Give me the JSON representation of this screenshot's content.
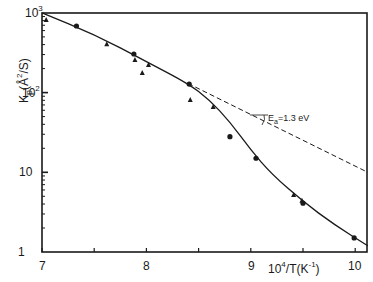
{
  "chart_data": {
    "type": "scatter",
    "title": "",
    "xlabel": "10^4/T(K^-1)",
    "ylabel": "Kp(Å^2/S)",
    "xlim": [
      7,
      10.12
    ],
    "ylim": [
      1,
      1000
    ],
    "yscale": "log",
    "grid": false,
    "legend": null,
    "x_ticks": [
      7,
      8,
      9,
      10
    ],
    "x_minor_ticks": [
      7.5,
      8.5,
      9.5
    ],
    "y_ticks": [
      "1",
      "10",
      "10^2",
      "10^3"
    ],
    "series": [
      {
        "name": "circles",
        "marker": "circle",
        "points": [
          {
            "x": 7.33,
            "y": 685
          },
          {
            "x": 7.88,
            "y": 305
          },
          {
            "x": 8.41,
            "y": 128
          },
          {
            "x": 8.8,
            "y": 28
          },
          {
            "x": 9.05,
            "y": 15
          },
          {
            "x": 9.5,
            "y": 4.1
          },
          {
            "x": 9.99,
            "y": 1.5
          }
        ]
      },
      {
        "name": "triangles",
        "marker": "triangle",
        "points": [
          {
            "x": 7.04,
            "y": 813
          },
          {
            "x": 7.62,
            "y": 405
          },
          {
            "x": 7.89,
            "y": 256
          },
          {
            "x": 7.96,
            "y": 176
          },
          {
            "x": 8.02,
            "y": 222
          },
          {
            "x": 8.42,
            "y": 81
          },
          {
            "x": 8.64,
            "y": 66
          },
          {
            "x": 9.41,
            "y": 5.2
          },
          {
            "x": 9.49,
            "y": 4.4
          }
        ]
      },
      {
        "name": "fit-curve",
        "style": "solid",
        "points": [
          {
            "x": 7.0,
            "y": 1000
          },
          {
            "x": 7.5,
            "y": 540
          },
          {
            "x": 8.0,
            "y": 245
          },
          {
            "x": 8.4,
            "y": 130
          },
          {
            "x": 8.6,
            "y": 82
          },
          {
            "x": 8.8,
            "y": 43
          },
          {
            "x": 9.0,
            "y": 19
          },
          {
            "x": 9.2,
            "y": 9.5
          },
          {
            "x": 9.5,
            "y": 4.3
          },
          {
            "x": 9.8,
            "y": 2.2
          },
          {
            "x": 10.12,
            "y": 1.2
          }
        ]
      },
      {
        "name": "extrapolation",
        "style": "dashed",
        "points": [
          {
            "x": 8.4,
            "y": 130
          },
          {
            "x": 10.12,
            "y": 10
          }
        ]
      }
    ],
    "annotations": [
      {
        "text": "Ea=1.3 eV",
        "x": 9.15,
        "y": 45
      }
    ]
  },
  "labels": {
    "y_tick_1": "1",
    "y_tick_10": "10",
    "y_tick_100_base": "10",
    "y_tick_100_exp": "2",
    "y_tick_1000_base": "10",
    "y_tick_1000_exp": "3",
    "x_tick_7": "7",
    "x_tick_8": "8",
    "x_tick_9": "9",
    "x_tick_10": "10",
    "ylabel_main": "K",
    "ylabel_sub": "p",
    "ylabel_rest": "(Å",
    "ylabel_exp": "2",
    "ylabel_tail": "/S)",
    "xlabel_base": "10",
    "xlabel_exp": "4",
    "xlabel_mid": "/T(K",
    "xlabel_exp2": "-1",
    "xlabel_tail": ")",
    "annot_E": "E",
    "annot_sub": "a",
    "annot_val": "=1.3 eV"
  },
  "colors": {
    "ink": "#1a1a1a",
    "background": "#ffffff"
  }
}
